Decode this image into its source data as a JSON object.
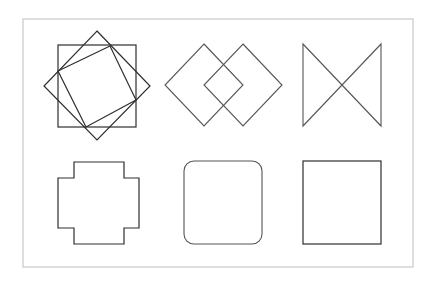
{
  "diagram": {
    "type": "geometric-figures",
    "layout": {
      "rows": 2,
      "columns": 3
    },
    "colors": {
      "line": "#2e2e2e",
      "frame": "#bdbdbd",
      "background": "#ffffff"
    },
    "frame": {
      "x": 23,
      "y": 19,
      "width": 390,
      "height": 248
    },
    "figures": [
      {
        "id": "overlapping-squares",
        "row": 1,
        "col": 1,
        "description": "Square with superimposed diamond and inscribed tilted square",
        "square": {
          "x": 58,
          "y": 45,
          "width": 78,
          "height": 82
        },
        "diamond": [
          [
            97,
            31
          ],
          [
            150,
            86
          ],
          [
            97,
            140
          ],
          [
            44,
            86
          ]
        ],
        "tilted_square": [
          [
            58,
            71
          ],
          [
            110,
            46
          ],
          [
            136,
            100
          ],
          [
            86,
            127
          ]
        ]
      },
      {
        "id": "interlocking-diamonds",
        "row": 1,
        "col": 2,
        "description": "Two overlapping diamonds",
        "left_diamond": [
          [
            204,
            44
          ],
          [
            243,
            85
          ],
          [
            204,
            126
          ],
          [
            165,
            85
          ]
        ],
        "right_diamond": [
          [
            243,
            44
          ],
          [
            282,
            85
          ],
          [
            243,
            126
          ],
          [
            204,
            85
          ]
        ]
      },
      {
        "id": "bowtie",
        "row": 1,
        "col": 3,
        "description": "Two triangles meeting at a point (hourglass on its side)",
        "points": [
          [
            303,
            44
          ],
          [
            381,
            126
          ],
          [
            381,
            44
          ],
          [
            303,
            126
          ]
        ]
      },
      {
        "id": "cross",
        "row": 2,
        "col": 1,
        "description": "Plus/cross shaped polygon",
        "points": [
          [
            74,
            162
          ],
          [
            124,
            162
          ],
          [
            124,
            178
          ],
          [
            139,
            178
          ],
          [
            139,
            228
          ],
          [
            124,
            228
          ],
          [
            124,
            244
          ],
          [
            74,
            244
          ],
          [
            74,
            228
          ],
          [
            58,
            228
          ],
          [
            58,
            178
          ],
          [
            74,
            178
          ]
        ]
      },
      {
        "id": "rounded-square",
        "row": 2,
        "col": 2,
        "description": "Square with rounded corners",
        "rect": {
          "x": 184,
          "y": 161,
          "width": 78,
          "height": 83,
          "radius": 10
        }
      },
      {
        "id": "square",
        "row": 2,
        "col": 3,
        "description": "Plain square",
        "rect": {
          "x": 303,
          "y": 161,
          "width": 78,
          "height": 83
        }
      }
    ]
  }
}
